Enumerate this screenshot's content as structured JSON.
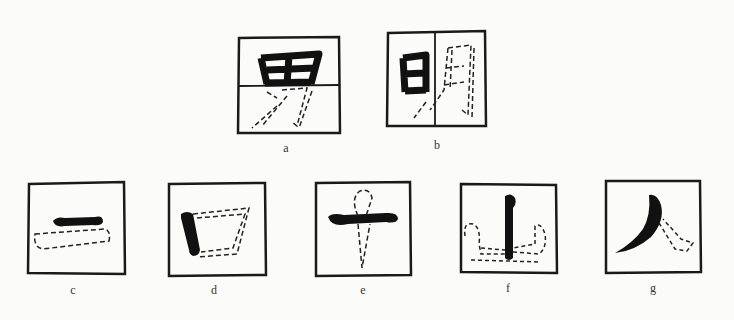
{
  "figure": {
    "colors": {
      "ink": "#111111",
      "frame": "#1a1a1a",
      "dashed": "#222222",
      "background": "#fbfbfa"
    },
    "panels": [
      {
        "id": "a",
        "label": "a",
        "character": "男",
        "note": "top half 田 solid, bottom half 力 dashed, horizontal divider"
      },
      {
        "id": "b",
        "label": "b",
        "character": "明",
        "note": "left 日 solid, right 月 dashed, vertical divider"
      },
      {
        "id": "c",
        "label": "c",
        "character": "一",
        "note": "horizontal stroke solid with dashed outline below"
      },
      {
        "id": "d",
        "label": "d",
        "character": "口",
        "note": "left vertical stroke solid, remaining strokes dashed"
      },
      {
        "id": "e",
        "label": "e",
        "character": "十",
        "note": "horizontal stroke solid, vertical stroke dashed"
      },
      {
        "id": "f",
        "label": "f",
        "character": "山",
        "note": "central vertical stroke solid, side strokes dashed"
      },
      {
        "id": "g",
        "label": "g",
        "character": "人",
        "note": "left-falling stroke solid, right-falling stroke dashed"
      }
    ]
  }
}
